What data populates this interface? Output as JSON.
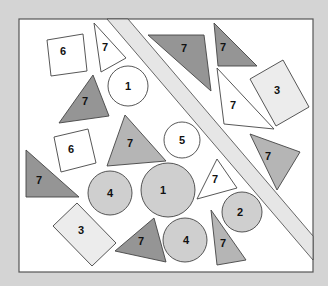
{
  "colors": {
    "background": "#d4d4d4",
    "panel": "#ffffff",
    "panel_border": "#555555",
    "outline": "#444444",
    "white_fill": "#ffffff",
    "light_fill": "#ececec",
    "gray_fill": "#cfcfcf",
    "medium_fill": "#b5b5b5",
    "dark_fill": "#959595",
    "strip_fill": "#e6e6e6"
  },
  "panel": {
    "x": 19,
    "y": 19,
    "width": 294,
    "height": 253
  },
  "strip": {
    "outer": "107,19 128,19 313,236 313,260",
    "inner_line_a": "107,19 313,260",
    "inner_line_b": "128,19 313,236"
  },
  "shapes": [
    {
      "id": "square-6-top",
      "type": "polygon",
      "points": "47,40 83,34 87,71 51,76",
      "fill": "white_fill",
      "label": "6",
      "lx": 63,
      "ly": 55
    },
    {
      "id": "triangle-7-top-white",
      "type": "polygon",
      "points": "94,23 126,58 101,72",
      "fill": "white_fill",
      "label": "7",
      "lx": 105,
      "ly": 51
    },
    {
      "id": "circle-1-white",
      "type": "circle",
      "cx": 128,
      "cy": 86,
      "r": 20,
      "fill": "white_fill",
      "label": "1",
      "lx": 128,
      "ly": 90
    },
    {
      "id": "triangle-7-dark-top",
      "type": "polygon",
      "points": "148,35 204,35 211,91",
      "fill": "dark_fill",
      "label": "7",
      "lx": 184,
      "ly": 52
    },
    {
      "id": "triangle-7-dark-topright",
      "type": "polygon",
      "points": "214,23 257,66 218,66",
      "fill": "dark_fill",
      "label": "7",
      "lx": 223,
      "ly": 51
    },
    {
      "id": "rect-3-right",
      "type": "polygon",
      "points": "250,79 283,60 309,107 276,126",
      "fill": "light_fill",
      "label": "3",
      "lx": 277,
      "ly": 94
    },
    {
      "id": "triangle-7-white-right",
      "type": "polygon",
      "points": "217,68 274,129 224,124",
      "fill": "white_fill",
      "label": "7",
      "lx": 233,
      "ly": 109
    },
    {
      "id": "triangle-7-dark-left",
      "type": "polygon",
      "points": "93,75 109,116 59,123",
      "fill": "dark_fill",
      "label": "7",
      "lx": 85,
      "ly": 105
    },
    {
      "id": "triangle-7-gray-center",
      "type": "polygon",
      "points": "125,115 166,161 107,166",
      "fill": "medium_fill",
      "label": "7",
      "lx": 130,
      "ly": 147
    },
    {
      "id": "circle-5-white",
      "type": "circle",
      "cx": 182,
      "cy": 140,
      "r": 18,
      "fill": "white_fill",
      "label": "5",
      "lx": 182,
      "ly": 144
    },
    {
      "id": "triangle-7-gray-right",
      "type": "polygon",
      "points": "250,134 300,152 277,190",
      "fill": "medium_fill",
      "label": "7",
      "lx": 268,
      "ly": 160
    },
    {
      "id": "square-6-left",
      "type": "polygon",
      "points": "54,137 88,129 96,163 61,172",
      "fill": "white_fill",
      "label": "6",
      "lx": 71,
      "ly": 153
    },
    {
      "id": "triangle-7-dark-bottomleft",
      "type": "polygon",
      "points": "26,150 79,197 26,197",
      "fill": "dark_fill",
      "label": "7",
      "lx": 39,
      "ly": 184
    },
    {
      "id": "circle-4-left",
      "type": "circle",
      "cx": 110,
      "cy": 193,
      "r": 22,
      "fill": "gray_fill",
      "label": "4",
      "lx": 110,
      "ly": 197
    },
    {
      "id": "circle-1-gray",
      "type": "circle",
      "cx": 168,
      "cy": 190,
      "r": 27,
      "fill": "gray_fill",
      "label": "1",
      "lx": 163,
      "ly": 194
    },
    {
      "id": "triangle-7-white-small",
      "type": "polygon",
      "points": "217,159 237,188 197,199",
      "fill": "white_fill",
      "label": "7",
      "lx": 215,
      "ly": 183
    },
    {
      "id": "circle-2",
      "type": "circle",
      "cx": 242,
      "cy": 212,
      "r": 20,
      "fill": "gray_fill",
      "label": "2",
      "lx": 240,
      "ly": 216
    },
    {
      "id": "rect-3-bottom",
      "type": "polygon",
      "points": "53,226 77,203 116,243 92,266",
      "fill": "light_fill",
      "label": "3",
      "lx": 81,
      "ly": 234
    },
    {
      "id": "triangle-7-dark-bottom",
      "type": "polygon",
      "points": "154,218 166,262 115,251",
      "fill": "dark_fill",
      "label": "7",
      "lx": 141,
      "ly": 245
    },
    {
      "id": "circle-4-bottom",
      "type": "circle",
      "cx": 185,
      "cy": 240,
      "r": 22,
      "fill": "gray_fill",
      "label": "4",
      "lx": 186,
      "ly": 244
    },
    {
      "id": "triangle-7-gray-bottomright",
      "type": "polygon",
      "points": "211,210 246,260 217,265",
      "fill": "medium_fill",
      "label": "7",
      "lx": 223,
      "ly": 247
    }
  ]
}
